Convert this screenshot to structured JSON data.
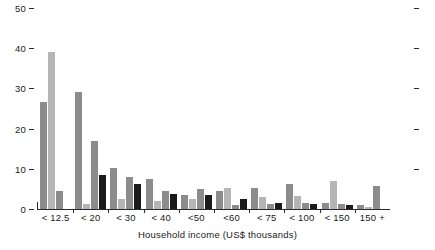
{
  "chart_data": {
    "type": "bar",
    "title": "",
    "xlabel": "Household income (US$ thousands)",
    "ylabel": "",
    "ylim": [
      0,
      50
    ],
    "yticks": [
      0,
      10,
      20,
      30,
      40,
      50
    ],
    "grid": false,
    "legend_position": "none",
    "categories": [
      "< 12.5",
      "< 20",
      "< 30",
      "< 40",
      "<50",
      "<60",
      "< 75",
      "< 100",
      "< 150",
      "150 +"
    ],
    "series": [
      {
        "name": "series-1",
        "color": "#8c8c8c",
        "values": [
          26.5,
          29.0,
          10.3,
          7.5,
          3.5,
          4.6,
          5.3,
          6.2,
          1.4,
          1.0
        ]
      },
      {
        "name": "series-2",
        "color": "#b5b5b5",
        "values": [
          39.0,
          1.3,
          2.4,
          2.0,
          2.4,
          5.3,
          2.9,
          3.2,
          7.0,
          0.5
        ]
      },
      {
        "name": "series-3",
        "color": "#8c8c8c",
        "values": [
          4.5,
          16.8,
          8.0,
          4.6,
          5.0,
          1.0,
          1.2,
          1.4,
          1.3,
          5.8
        ]
      },
      {
        "name": "series-4",
        "color": "#1a1a1a",
        "values": [
          0.0,
          8.5,
          6.2,
          3.7,
          3.5,
          2.4,
          1.5,
          1.3,
          1.0,
          0.0
        ]
      }
    ]
  },
  "axis": {
    "y_tick_labels": [
      "0",
      "10",
      "20",
      "30",
      "40",
      "50"
    ],
    "x_axis_title": "Household income (US$ thousands)"
  },
  "colors": {
    "series_1": "#8c8c8c",
    "series_2": "#b5b5b5",
    "series_3": "#8c8c8c",
    "series_4": "#1a1a1a",
    "axis": "#2a2a2a",
    "text": "#1a1a1a",
    "background": "#ffffff"
  }
}
